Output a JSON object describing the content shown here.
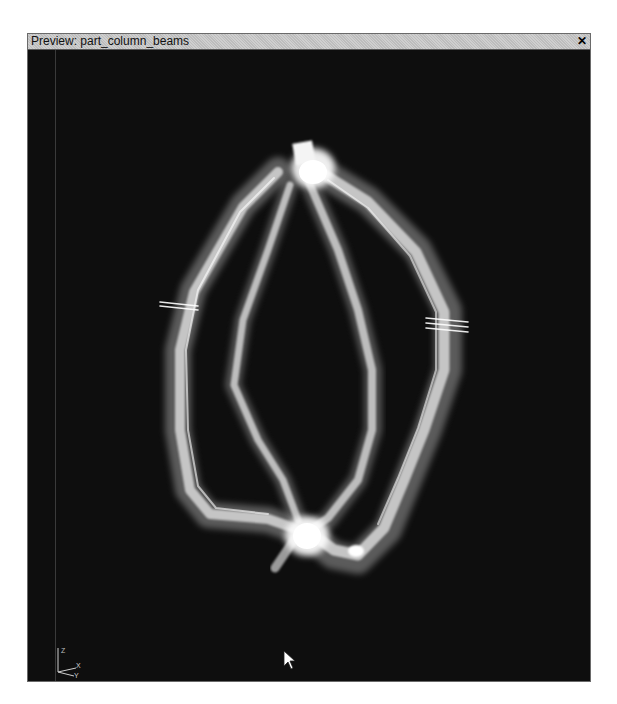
{
  "window": {
    "title": "Preview: part_column_beams",
    "close_icon": "close-icon"
  },
  "viewport": {
    "background": "#0e0e0e",
    "model_name": "part_column_beams",
    "axis_gizmo": {
      "labels": [
        "Z",
        "X",
        "Y"
      ]
    }
  },
  "colors": {
    "titlebar": "#c9c9c9",
    "tube": "#e8e8e8",
    "background": "#0e0e0e"
  }
}
